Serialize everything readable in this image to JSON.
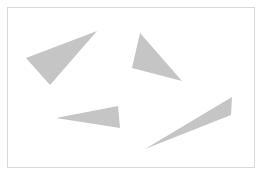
{
  "figure": {
    "width": 262,
    "height": 175,
    "background_color": "#ffffff",
    "shape_fill_color": "#c5c5c5",
    "shape_count": 4
  },
  "frame": {
    "name": "border-frame",
    "stroke_color": "#d9d9d9",
    "stroke_width": 1,
    "x": 7.5,
    "y": 7.5,
    "width": 247,
    "height": 160
  },
  "shapes": [
    {
      "id": "triangle-1",
      "label": "Upper left triangle",
      "fill": "#c5c5c5",
      "points": "26,58 97,31 50,85",
      "vertices": [
        [
          26,
          58
        ],
        [
          97,
          31
        ],
        [
          50,
          85
        ]
      ],
      "orientation": "pointing-right"
    },
    {
      "id": "triangle-2",
      "label": "Upper right triangle",
      "fill": "#c5c5c5",
      "points": "140,33 182,81 132,68",
      "vertices": [
        [
          140,
          33
        ],
        [
          182,
          81
        ],
        [
          132,
          68
        ]
      ],
      "orientation": "pointing-up"
    },
    {
      "id": "triangle-3",
      "label": "Middle left slender triangle",
      "fill": "#c5c5c5",
      "points": "56,118 118,106 120,128",
      "vertices": [
        [
          56,
          118
        ],
        [
          118,
          106
        ],
        [
          120,
          128
        ]
      ],
      "orientation": "pointing-left"
    },
    {
      "id": "triangle-4",
      "label": "Lower right elongated triangle",
      "fill": "#c5c5c5",
      "points": "145,149 232,97 231,115",
      "vertices": [
        [
          145,
          149
        ],
        [
          232,
          97
        ],
        [
          231,
          115
        ]
      ],
      "orientation": "pointing-lower-left"
    }
  ]
}
